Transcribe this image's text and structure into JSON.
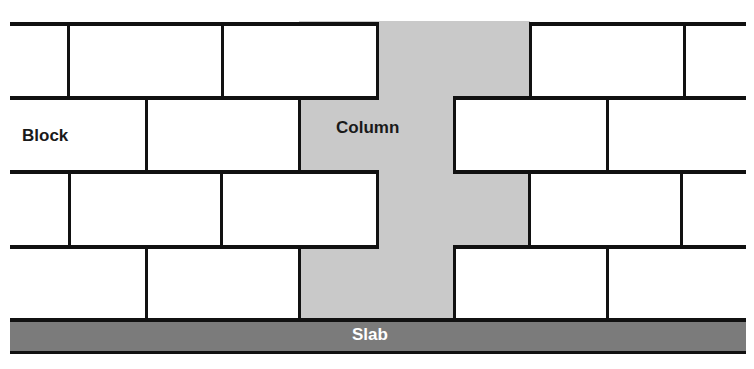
{
  "diagram": {
    "title": "",
    "labels": {
      "block": "Block",
      "column": "Column",
      "slab": "Slab"
    },
    "colors": {
      "column": "#c9c9c9",
      "slab": "#7b7b7b",
      "outline": "#111111",
      "block": "#ffffff"
    },
    "layout": {
      "courses": [
        {
          "top": 24,
          "bottom": 98,
          "left_wall": {
            "x0": 10,
            "x1": 377,
            "joints": [
              68,
              222
            ]
          },
          "right_wall": {
            "x0": 530,
            "x1": 746,
            "joints": [
              684
            ]
          }
        },
        {
          "top": 98,
          "bottom": 172,
          "left_wall": {
            "x0": 10,
            "x1": 299,
            "joints": [
              146
            ]
          },
          "right_wall": {
            "x0": 454,
            "x1": 746,
            "joints": [
              607
            ]
          }
        },
        {
          "top": 172,
          "bottom": 247,
          "left_wall": {
            "x0": 10,
            "x1": 377,
            "joints": [
              69,
              221
            ]
          },
          "right_wall": {
            "x0": 529,
            "x1": 746,
            "joints": [
              681
            ]
          }
        },
        {
          "top": 247,
          "bottom": 320,
          "left_wall": {
            "x0": 10,
            "x1": 299,
            "joints": [
              146
            ]
          },
          "right_wall": {
            "x0": 454,
            "x1": 746,
            "joints": [
              607
            ]
          }
        }
      ],
      "column": {
        "x0": 299,
        "x1": 530,
        "top": 21,
        "bottom": 320
      },
      "slab": {
        "x0": 10,
        "x1": 746,
        "top": 318,
        "bottom": 354
      }
    }
  }
}
